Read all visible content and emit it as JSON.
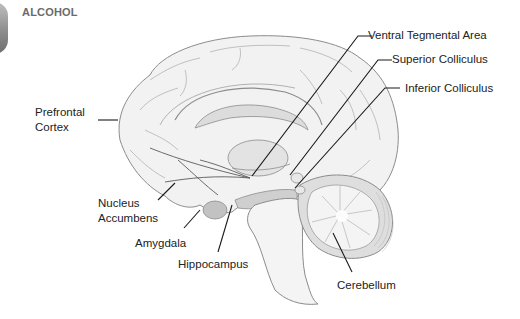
{
  "header": {
    "title": "ALCOHOL"
  },
  "diagram": {
    "labels": {
      "ventral_tegmental_area": "Ventral Tegmental Area",
      "superior_colliculus": "Superior Colliculus",
      "inferior_colliculus": "Inferior Colliculus",
      "prefrontal_cortex_line1": "Prefrontal",
      "prefrontal_cortex_line2": "Cortex",
      "nucleus_accumbens_line1": "Nucleus",
      "nucleus_accumbens_line2": "Accumbens",
      "amygdala": "Amygdala",
      "hippocampus": "Hippocampus",
      "cerebellum": "Cerebellum"
    },
    "colors": {
      "brain_fill": "#f1f1f1",
      "brain_outline": "#8c8c8c",
      "structure_fill": "#c9c9c9",
      "leader_line": "#1a1a1a"
    }
  }
}
